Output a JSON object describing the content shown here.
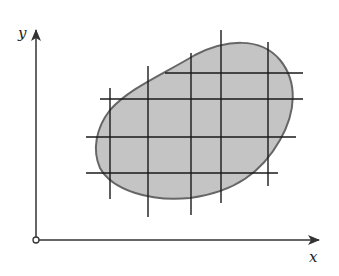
{
  "figure": {
    "width": 339,
    "height": 276,
    "background": "#ffffff"
  },
  "axes": {
    "origin": {
      "x": 36,
      "y": 240,
      "radius": 3
    },
    "x_axis": {
      "label": "x",
      "x_end": 319,
      "label_pos": {
        "x": 309,
        "y": 262
      }
    },
    "y_axis": {
      "label": "y",
      "y_end": 30,
      "label_pos": {
        "x": 18,
        "y": 38
      }
    },
    "color": "#333333"
  },
  "region": {
    "fill": "#c4c4c4",
    "stroke": "#666666",
    "path": "M 100 168 C 92 150, 96 128, 110 110 C 130 88, 160 76, 195 55 C 225 40, 260 36, 280 60 C 298 82, 296 112, 280 140 C 262 172, 235 192, 190 198 C 150 202, 112 190, 100 168 Z"
  },
  "grid": {
    "color": "#1a1a1a",
    "horizontal": [
      {
        "y": 73,
        "x1": 165,
        "x2": 303
      },
      {
        "y": 99,
        "x1": 100,
        "x2": 303
      },
      {
        "y": 137,
        "x1": 86,
        "x2": 296
      },
      {
        "y": 173,
        "x1": 86,
        "x2": 278
      }
    ],
    "vertical": [
      {
        "x": 110,
        "y1": 88,
        "y2": 199
      },
      {
        "x": 148,
        "y1": 66,
        "y2": 217
      },
      {
        "x": 191,
        "y1": 53,
        "y2": 215
      },
      {
        "x": 221,
        "y1": 30,
        "y2": 203
      },
      {
        "x": 268,
        "y1": 42,
        "y2": 186
      }
    ]
  }
}
